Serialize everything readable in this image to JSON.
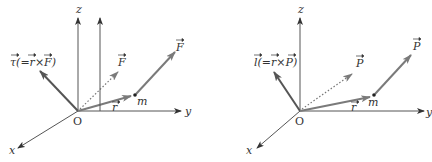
{
  "figures": [
    {
      "id": "torque",
      "axes": {
        "x": "x",
        "y": "y",
        "z": "z",
        "origin": "O"
      },
      "resultant_label": "τ(=r×F)",
      "resultant_sym": "τ",
      "resultant_eq_open": "(=",
      "resultant_r": "r",
      "resultant_times": "×",
      "resultant_vec2": "F",
      "resultant_close": ")",
      "position_label": "r",
      "mass_label": "m",
      "force_label": "F",
      "shifted_force_label": "F"
    },
    {
      "id": "angular-momentum",
      "axes": {
        "x": "x",
        "y": "y",
        "z": "z",
        "origin": "O"
      },
      "resultant_label": "l(=r×P)",
      "resultant_sym": "l",
      "resultant_eq_open": "(=",
      "resultant_r": "r",
      "resultant_times": "×",
      "resultant_vec2": "P",
      "resultant_close": ")",
      "position_label": "r",
      "mass_label": "m",
      "force_label": "P",
      "shifted_force_label": "P"
    }
  ],
  "colors": {
    "axis": "#555555",
    "vector": "#7a7a7a",
    "resultant": "#555555",
    "text": "#333333"
  }
}
